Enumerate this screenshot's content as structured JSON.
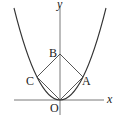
{
  "diagram": {
    "axes": {
      "x_label": "x",
      "y_label": "y",
      "origin_label": "O"
    },
    "points": {
      "O": {
        "label": "O"
      },
      "A": {
        "label": "A"
      },
      "B": {
        "label": "B"
      },
      "C": {
        "label": "C"
      }
    },
    "colors": {
      "stroke": "#333333",
      "background": "#ffffff"
    }
  }
}
